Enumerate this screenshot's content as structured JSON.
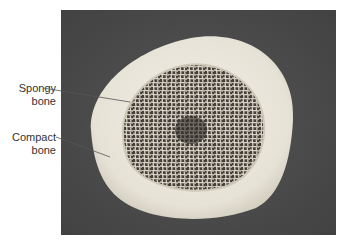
{
  "figure": {
    "type": "labeled-photograph",
    "labels": [
      {
        "id": "spongy",
        "line1": "Spongy",
        "line2": "bone"
      },
      {
        "id": "compact",
        "line1": "Compact",
        "line2": "bone"
      }
    ],
    "colors": {
      "photo_background": "#4b4b4b",
      "compact_bone": "#e9e6dc",
      "spongy_cavity": "#3a3530",
      "trabeculae": "#dcd7ca",
      "label_text": "#333333",
      "leader_line": "#555555"
    }
  }
}
